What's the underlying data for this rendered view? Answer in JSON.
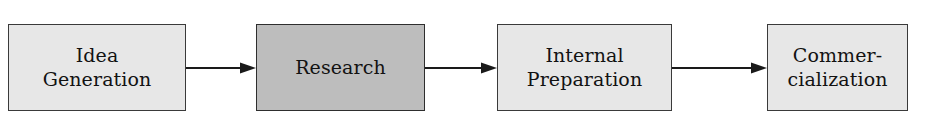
{
  "diagram": {
    "orientation": "left-to-right",
    "background_color": "#ffffff",
    "box_fill_default": "#e7e7e7",
    "box_fill_highlight": "#bdbdbd",
    "box_border_color": "#3a3a3a",
    "arrow_color": "#1a1a1a",
    "stages": [
      {
        "id": "idea-generation",
        "label": "Idea\nGeneration",
        "highlighted": false,
        "order": 1
      },
      {
        "id": "research",
        "label": "Research",
        "highlighted": true,
        "order": 2
      },
      {
        "id": "internal-preparation",
        "label": "Internal\nPreparation",
        "highlighted": false,
        "order": 3
      },
      {
        "id": "commercialization",
        "label": "Commer-\ncialization",
        "highlighted": false,
        "order": 4
      }
    ],
    "connectors": [
      {
        "id": "arrow-1",
        "from": "idea-generation",
        "to": "research",
        "icon": "arrow-right-icon"
      },
      {
        "id": "arrow-2",
        "from": "research",
        "to": "internal-preparation",
        "icon": "arrow-right-icon"
      },
      {
        "id": "arrow-3",
        "from": "internal-preparation",
        "to": "commercialization",
        "icon": "arrow-right-icon"
      }
    ]
  }
}
